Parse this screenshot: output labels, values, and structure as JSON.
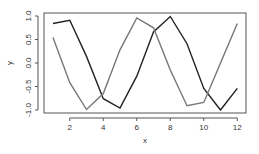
{
  "chart_data": {
    "type": "line",
    "title": "",
    "xlabel": "x",
    "ylabel": "y",
    "x": [
      1,
      2,
      3,
      4,
      5,
      6,
      7,
      8,
      9,
      10,
      11,
      12
    ],
    "series": [
      {
        "name": "sin(x)",
        "color": "#222222",
        "values": [
          0.84,
          0.91,
          0.14,
          -0.76,
          -0.96,
          -0.28,
          0.66,
          0.99,
          0.41,
          -0.54,
          -1.0,
          -0.54
        ]
      },
      {
        "name": "cos(x)",
        "color": "#777777",
        "values": [
          0.54,
          -0.42,
          -0.99,
          -0.65,
          0.28,
          0.96,
          0.75,
          -0.15,
          -0.91,
          -0.84,
          0.0,
          0.84
        ]
      }
    ],
    "xticks": [
      "2",
      "4",
      "6",
      "8",
      "10",
      "12"
    ],
    "yticks": [
      "-1.0",
      "-0.5",
      "0.0",
      "0.5",
      "1.0"
    ],
    "xlim": [
      0.56,
      12.44
    ],
    "ylim": [
      -1.08,
      1.08
    ],
    "grid": false,
    "legend": "none"
  }
}
